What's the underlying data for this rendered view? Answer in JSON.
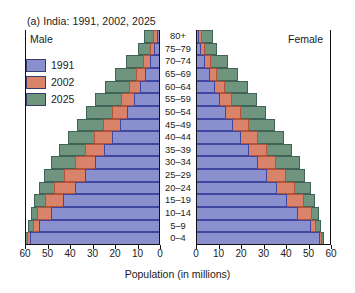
{
  "figure": {
    "title": "(a)  India: 1991, 2002, 2025",
    "male_label": "Male",
    "female_label": "Female",
    "xlabel": "Population (in millions)"
  },
  "legend": {
    "entries": [
      {
        "label": "1991",
        "color": "#8a90ce"
      },
      {
        "label": "2002",
        "color": "#d9836a"
      },
      {
        "label": "2025",
        "color": "#70957f"
      }
    ]
  },
  "axis": {
    "ticks": [
      0,
      10,
      20,
      30,
      40,
      50,
      60
    ],
    "max": 60,
    "left_tick_labels": [
      "60",
      "50",
      "40",
      "30",
      "20",
      "10",
      "0"
    ],
    "right_tick_labels": [
      "0",
      "10",
      "20",
      "30",
      "40",
      "50",
      "60"
    ]
  },
  "chart_data": {
    "type": "bar",
    "subtype": "population-pyramid",
    "title": "(a)  India: 1991, 2002, 2025",
    "xlabel": "Population (in millions)",
    "ylabel": "",
    "xlim": [
      0,
      60
    ],
    "grid": false,
    "legend_position": "upper-left",
    "orientation": "horizontal-back-to-back",
    "categories": [
      "0–4",
      "5–9",
      "10–14",
      "15–19",
      "20–24",
      "25–29",
      "30–34",
      "35–39",
      "40–44",
      "45–49",
      "50–54",
      "55–59",
      "60–64",
      "65–69",
      "70–74",
      "75–79",
      "80+"
    ],
    "series": [
      {
        "name": "1991",
        "color": "#8a90ce",
        "male": [
          58.0,
          54.0,
          48.5,
          43.0,
          38.0,
          33.5,
          29.0,
          25.0,
          21.5,
          18.0,
          14.5,
          11.5,
          9.0,
          6.5,
          4.5,
          2.5,
          1.5
        ],
        "female": [
          55.0,
          51.0,
          45.5,
          40.5,
          36.0,
          31.5,
          27.5,
          23.5,
          20.0,
          16.5,
          13.5,
          10.5,
          8.5,
          6.0,
          4.0,
          2.3,
          1.5
        ]
      },
      {
        "name": "2002",
        "color": "#d9836a",
        "male": [
          59.0,
          56.5,
          54.5,
          51.0,
          47.0,
          42.5,
          38.0,
          33.5,
          29.5,
          25.5,
          21.5,
          17.5,
          14.0,
          10.5,
          7.5,
          4.5,
          3.0
        ],
        "female": [
          56.0,
          53.5,
          51.5,
          48.0,
          44.0,
          40.0,
          35.5,
          31.5,
          27.5,
          23.5,
          20.0,
          16.0,
          13.0,
          9.5,
          6.5,
          4.0,
          2.8
        ]
      },
      {
        "name": "2025",
        "color": "#70957f",
        "male": [
          60.0,
          58.5,
          57.5,
          56.0,
          54.0,
          51.5,
          48.5,
          45.0,
          41.0,
          37.0,
          33.0,
          29.0,
          24.5,
          20.0,
          15.0,
          10.0,
          7.0
        ],
        "female": [
          57.0,
          55.5,
          54.5,
          53.0,
          51.0,
          48.5,
          46.0,
          42.5,
          39.0,
          35.0,
          31.0,
          27.0,
          23.0,
          18.5,
          14.0,
          9.5,
          7.5
        ]
      }
    ]
  }
}
